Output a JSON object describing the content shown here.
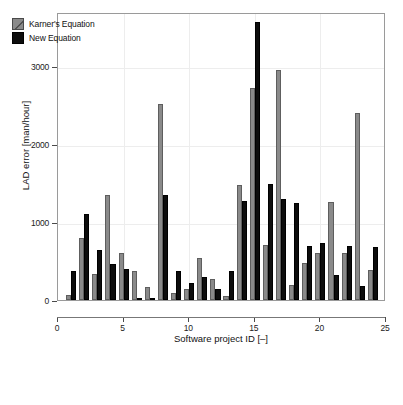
{
  "chart_data": {
    "type": "bar",
    "title": "",
    "xlabel": "Software project ID [–]",
    "ylabel": "LAD error [man/hour]",
    "xlim": [
      0,
      25
    ],
    "ylim": [
      0,
      3700
    ],
    "xticks": [
      0,
      5,
      10,
      15,
      20,
      25
    ],
    "yticks": [
      0,
      1000,
      2000,
      3000
    ],
    "ytick_labels": [
      "0",
      "1000",
      "2000",
      "3000"
    ],
    "xtick_labels": [
      "0",
      "5",
      "10",
      "15",
      "20",
      "25"
    ],
    "grid": true,
    "legend_position": "top-left",
    "categories": [
      1,
      2,
      3,
      4,
      5,
      6,
      7,
      8,
      9,
      10,
      11,
      12,
      13,
      14,
      15,
      16,
      17,
      18,
      19,
      20,
      21,
      22,
      23,
      24
    ],
    "series": [
      {
        "name": "Karner's Equation",
        "color": "#8a8a8a",
        "values": [
          60,
          800,
          330,
          1350,
          600,
          370,
          170,
          2520,
          85,
          140,
          540,
          265,
          55,
          1480,
          2720,
          710,
          2950,
          195,
          475,
          600,
          1260,
          605,
          2400,
          385
        ]
      },
      {
        "name": "New Equation",
        "color": "#0d0d0d",
        "values": [
          375,
          1110,
          645,
          460,
          400,
          20,
          25,
          1350,
          370,
          215,
          290,
          140,
          370,
          1270,
          3570,
          1490,
          1300,
          1250,
          700,
          730,
          320,
          695,
          180,
          680
        ]
      }
    ]
  },
  "legend": {
    "items": [
      {
        "label": "Karner's Equation",
        "swatch": "gray-hatched-swatch"
      },
      {
        "label": "New Equation",
        "swatch": "black-swatch"
      }
    ]
  },
  "colors": {
    "series_gray": "#8a8a8a",
    "series_black": "#0d0d0d",
    "frame": "#9a9a9a",
    "grid": "#ededed",
    "background": "#ffffff"
  }
}
